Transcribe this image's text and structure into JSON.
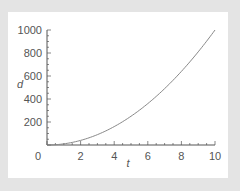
{
  "chart_data": {
    "type": "line",
    "title": "",
    "xlabel": "t",
    "ylabel": "d",
    "xlim": [
      0,
      10
    ],
    "ylim": [
      0,
      1000
    ],
    "xticks": [
      "0",
      "2",
      "4",
      "6",
      "8",
      "10"
    ],
    "yticks": [
      "200",
      "400",
      "600",
      "800",
      "1000"
    ],
    "grid": false,
    "legend": null,
    "series": [
      {
        "name": "d = 10t^2",
        "x": [
          0,
          1,
          2,
          3,
          4,
          5,
          6,
          7,
          8,
          9,
          10
        ],
        "values": [
          0,
          10,
          40,
          90,
          160,
          250,
          360,
          490,
          640,
          810,
          1000
        ]
      }
    ],
    "colors": {
      "line": "#888888",
      "axis": "#555555",
      "background": "#ffffff",
      "frame": "#e4e4e4"
    }
  }
}
